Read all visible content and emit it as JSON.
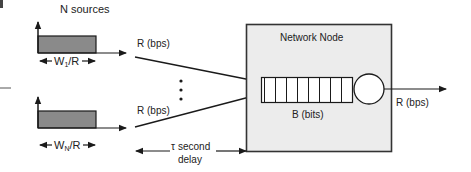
{
  "diagram": {
    "title": "N sources",
    "sources": [
      {
        "id": "source-1",
        "width_label_main": "W",
        "width_label_sub": "1",
        "width_label_tail": "/R",
        "rate_label": "R (bps)"
      },
      {
        "id": "source-n",
        "width_label_main": "W",
        "width_label_sub": "N",
        "width_label_tail": "/R",
        "rate_label": "R (bps)"
      }
    ],
    "ellipsis": "⋮",
    "node": {
      "title": "Network Node",
      "buffer_label": "B (bits)",
      "buffer_cells": 8,
      "output_rate_label": "R (bps)"
    },
    "delay": {
      "symbol": "τ",
      "line1": "second",
      "line2": "delay"
    },
    "colors": {
      "line": "#1a1a1a",
      "pulse_fill": "#8a8a8a",
      "node_fill": "#ececec",
      "node_border": "#333333"
    }
  }
}
